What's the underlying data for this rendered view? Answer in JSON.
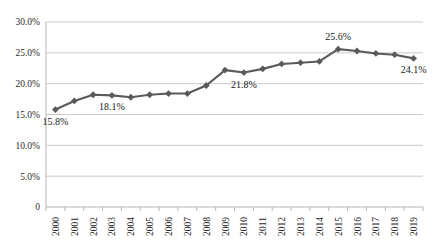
{
  "chart_data": {
    "type": "line",
    "title": "",
    "xlabel": "",
    "ylabel": "",
    "categories": [
      "2000",
      "2001",
      "2002",
      "2003",
      "2004",
      "2005",
      "2006",
      "2007",
      "2008",
      "2009",
      "2010",
      "2011",
      "2012",
      "2013",
      "2014",
      "2015",
      "2016",
      "2017",
      "2018",
      "2019"
    ],
    "values": [
      15.8,
      17.2,
      18.2,
      18.1,
      17.8,
      18.2,
      18.4,
      18.4,
      19.7,
      22.2,
      21.8,
      22.4,
      23.2,
      23.4,
      23.6,
      25.6,
      25.3,
      24.9,
      24.7,
      24.1
    ],
    "series": [
      {
        "name": "",
        "values": [
          15.8,
          17.2,
          18.2,
          18.1,
          17.8,
          18.2,
          18.4,
          18.4,
          19.7,
          22.2,
          21.8,
          22.4,
          23.2,
          23.4,
          23.6,
          25.6,
          25.3,
          24.9,
          24.7,
          24.1
        ]
      }
    ],
    "ylim": [
      0,
      30
    ],
    "ytick_values": [
      0,
      5,
      10,
      15,
      20,
      25,
      30
    ],
    "ytick_labels": [
      "0",
      "5.0%",
      "10.0%",
      "15.0%",
      "20.0%",
      "25.0%",
      "30.0%"
    ],
    "grid": true,
    "legend": "none",
    "marker": "diamond",
    "line_color": "#5a5a5a",
    "marker_color": "#5a5a5a",
    "grid_color": "#c9c9c9",
    "axis_color": "#b5b5b5",
    "background": "#ffffff",
    "data_labels": [
      {
        "category": "2000",
        "value": 15.8,
        "text": "15.8%",
        "position": "below"
      },
      {
        "category": "2003",
        "value": 18.1,
        "text": "18.1%",
        "position": "below"
      },
      {
        "category": "2010",
        "value": 21.8,
        "text": "21.8%",
        "position": "below"
      },
      {
        "category": "2015",
        "value": 25.6,
        "text": "25.6%",
        "position": "above"
      },
      {
        "category": "2019",
        "value": 24.1,
        "text": "24.1%",
        "position": "below"
      }
    ]
  }
}
